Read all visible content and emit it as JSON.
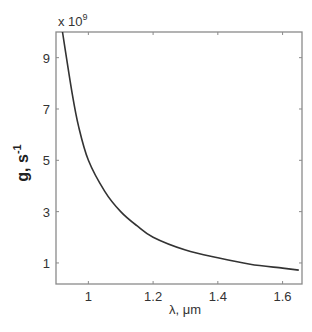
{
  "chart_data": {
    "type": "line",
    "title": "",
    "xlabel": "λ, μm",
    "ylabel": "g, s",
    "ylabel_superscript": "-1",
    "y_multiplier_label": "x 10",
    "y_multiplier_exp": "9",
    "xlim": [
      0.9,
      1.66
    ],
    "ylim": [
      0.18,
      10
    ],
    "x_ticks": [
      1,
      1.2,
      1.4,
      1.6
    ],
    "x_tick_labels": [
      "1",
      "1.2",
      "1.4",
      "1.6"
    ],
    "y_ticks": [
      1,
      3,
      5,
      7,
      9
    ],
    "y_tick_labels": [
      "1",
      "3",
      "5",
      "7",
      "9"
    ],
    "grid": false,
    "legend": null,
    "series": [
      {
        "name": "g(λ)",
        "color": "#333333",
        "x": [
          0.92,
          0.95,
          0.97,
          1.0,
          1.05,
          1.1,
          1.15,
          1.2,
          1.3,
          1.4,
          1.5,
          1.6,
          1.65
        ],
        "values": [
          10.0,
          7.6,
          6.3,
          5.0,
          3.8,
          3.0,
          2.45,
          2.0,
          1.5,
          1.2,
          0.95,
          0.8,
          0.72
        ]
      }
    ]
  }
}
